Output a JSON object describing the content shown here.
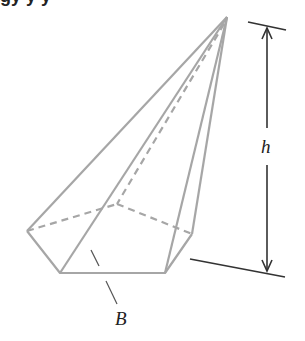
{
  "header": {
    "title_cut": "gy   y   y"
  },
  "diagram": {
    "labels": {
      "height": "h",
      "base": "B"
    },
    "colors": {
      "edge": "#a6a6a6",
      "dimension": "#333333",
      "text": "#222222"
    },
    "vertices": {
      "apex": [
        227,
        17
      ],
      "left": [
        27,
        231
      ],
      "front_left": [
        60,
        273
      ],
      "front_right": [
        165,
        273
      ],
      "right": [
        192,
        234
      ],
      "back": [
        117,
        204
      ]
    }
  }
}
